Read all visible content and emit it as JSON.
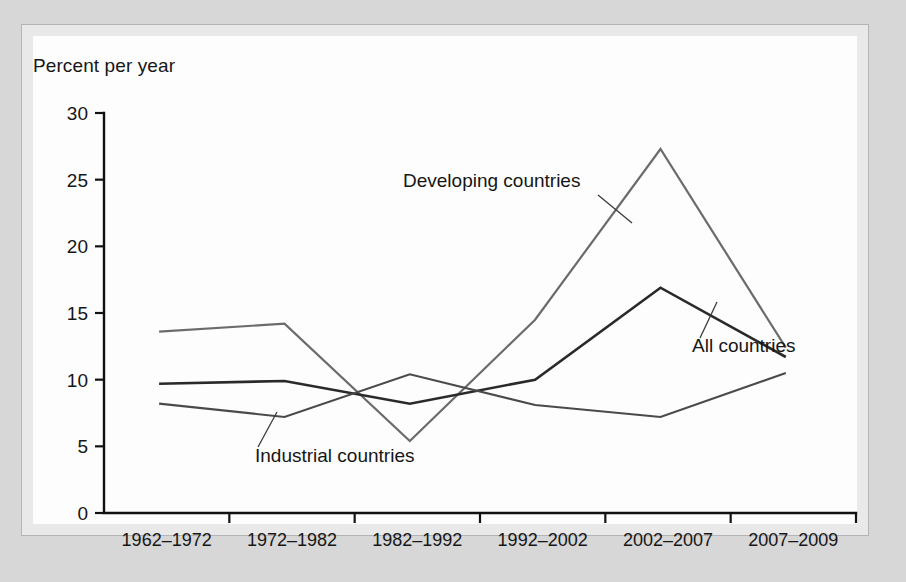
{
  "figure": {
    "background_color": "#d7d7d7",
    "panel_color": "#e9e9e9",
    "card_color": "#fdfdfd",
    "border_color": "#b4b4b4"
  },
  "chart_data": {
    "type": "line",
    "title": "",
    "subtitle": "",
    "ylabel": "Percent per year",
    "xlabel": "",
    "ylim": [
      0,
      30
    ],
    "yticks": [
      0,
      5,
      10,
      15,
      20,
      25,
      30
    ],
    "ytick_labels": [
      "0",
      "5",
      "10",
      "15",
      "20",
      "25",
      "30"
    ],
    "grid": false,
    "legend": "inline-annotations",
    "categories": [
      "1962–1972",
      "1972–1982",
      "1982–1992",
      "1992–2002",
      "2002–2007",
      "2007–2009"
    ],
    "series": [
      {
        "name": "Developing countries",
        "color": "#6b6b6b",
        "line_width": 2.2,
        "values": [
          13.6,
          14.2,
          5.4,
          14.5,
          27.3,
          12.4
        ]
      },
      {
        "name": "All countries",
        "color": "#2a2a2a",
        "line_width": 2.6,
        "values": [
          9.7,
          9.9,
          8.2,
          10.0,
          16.9,
          11.7
        ]
      },
      {
        "name": "Industrial countries",
        "color": "#4a4a4a",
        "line_width": 2.2,
        "values": [
          8.2,
          7.2,
          10.4,
          8.1,
          7.2,
          10.5
        ]
      }
    ],
    "annotations": [
      {
        "text": "Developing countries",
        "label_x": 403,
        "label_y": 187,
        "leader_from_x": 598,
        "leader_from_y": 195,
        "leader_to_x": 632,
        "leader_to_y": 223
      },
      {
        "text": "All countries",
        "label_x": 692,
        "label_y": 352,
        "leader_from_x": 700,
        "leader_from_y": 338,
        "leader_to_x": 717,
        "leader_to_y": 302
      },
      {
        "text": "Industrial countries",
        "label_x": 255,
        "label_y": 462,
        "leader_from_x": 258,
        "leader_from_y": 447,
        "leader_to_x": 277,
        "leader_to_y": 412
      }
    ]
  }
}
